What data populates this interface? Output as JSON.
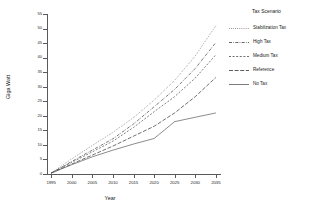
{
  "chart_data": {
    "type": "line",
    "title": "",
    "xlabel": "Year",
    "ylabel": "Giga Watt",
    "xlim": [
      1994,
      2036
    ],
    "ylim": [
      0,
      55
    ],
    "grid": false,
    "legend_position": "right",
    "legend_title": "Tax Scenario",
    "x": [
      1995,
      2000,
      2005,
      2010,
      2015,
      2020,
      2025,
      2030,
      2035
    ],
    "xticks": [
      "1995",
      "2000",
      "2005",
      "2010",
      "2015",
      "2020",
      "2025",
      "2030",
      "2035"
    ],
    "yticks": [
      "0",
      "5",
      "10",
      "15",
      "20",
      "25",
      "30",
      "35",
      "40",
      "45",
      "50",
      "55"
    ],
    "series": [
      {
        "name": "Stabilization Tax",
        "style": "dotted",
        "color": "#4a4a4a",
        "values": [
          0.3,
          5.2,
          9.8,
          14.3,
          19.4,
          25.4,
          32.2,
          40.6,
          51.0
        ]
      },
      {
        "name": "High Tax",
        "style": "dash-dot",
        "color": "#3d3d3d",
        "values": [
          0.3,
          4.3,
          8.2,
          12.1,
          17.2,
          23.1,
          29.1,
          36.3,
          45.2
        ]
      },
      {
        "name": "Medium Tax",
        "style": "dashed",
        "color": "#4a4a4a",
        "values": [
          0.3,
          4.0,
          7.6,
          11.3,
          16.0,
          21.4,
          26.6,
          33.0,
          41.0
        ]
      },
      {
        "name": "Reference",
        "style": "long-dash",
        "color": "#333333",
        "values": [
          0.3,
          3.4,
          6.5,
          9.6,
          13.0,
          16.4,
          21.0,
          26.6,
          33.2
        ]
      },
      {
        "name": "No Tax",
        "style": "solid",
        "color": "#5a5a5a",
        "values": [
          0.3,
          3.2,
          5.9,
          8.2,
          10.3,
          12.2,
          18.0,
          19.5,
          21.0
        ]
      }
    ]
  }
}
